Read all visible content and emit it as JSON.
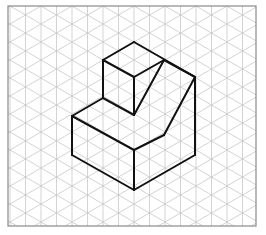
{
  "figure": {
    "type": "isometric-drawing",
    "colors": {
      "background": "#ffffff",
      "grid": "#c8c8c8",
      "border": "#8a8a8a",
      "outline": "#111111"
    },
    "frame": {
      "x": 8,
      "y": 6,
      "width": 248,
      "height": 220
    },
    "grid": {
      "spacing_x": 15.5,
      "spacing_y": 18.0
    },
    "edges": [
      [
        [
          134,
          42
        ],
        [
          103,
          60
        ]
      ],
      [
        [
          134,
          42
        ],
        [
          195,
          77
        ]
      ],
      [
        [
          103,
          60
        ],
        [
          134,
          77
        ]
      ],
      [
        [
          134,
          77
        ],
        [
          164,
          60
        ]
      ],
      [
        [
          103,
          60
        ],
        [
          103,
          98
        ]
      ],
      [
        [
          134,
          77
        ],
        [
          134,
          115
        ]
      ],
      [
        [
          164,
          60
        ],
        [
          134,
          115
        ]
      ],
      [
        [
          164,
          60
        ],
        [
          195,
          77
        ]
      ],
      [
        [
          195,
          77
        ],
        [
          164,
          135
        ]
      ],
      [
        [
          195,
          77
        ],
        [
          195,
          155
        ]
      ],
      [
        [
          103,
          98
        ],
        [
          72,
          116
        ]
      ],
      [
        [
          103,
          98
        ],
        [
          134,
          115
        ]
      ],
      [
        [
          72,
          116
        ],
        [
          134,
          150
        ]
      ],
      [
        [
          134,
          150
        ],
        [
          164,
          135
        ]
      ],
      [
        [
          72,
          116
        ],
        [
          72,
          155
        ]
      ],
      [
        [
          134,
          150
        ],
        [
          134,
          190
        ]
      ],
      [
        [
          72,
          155
        ],
        [
          134,
          190
        ]
      ],
      [
        [
          134,
          190
        ],
        [
          195,
          155
        ]
      ]
    ]
  }
}
